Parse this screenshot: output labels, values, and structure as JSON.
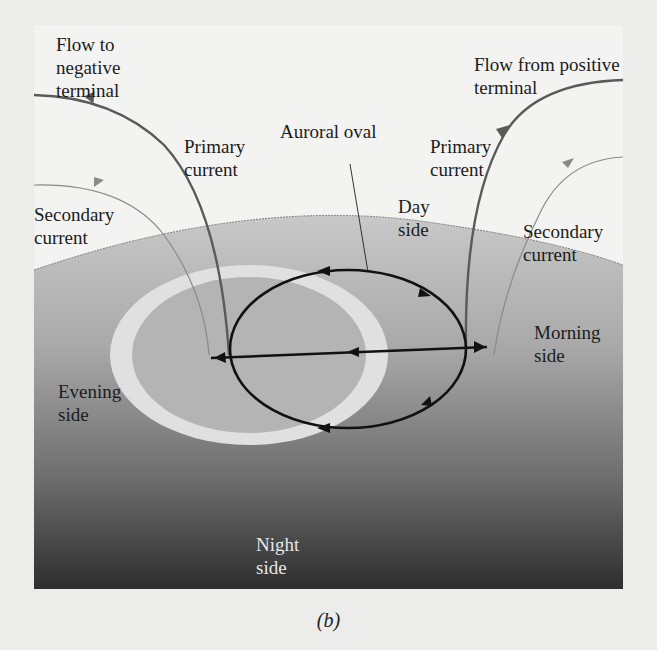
{
  "figure": {
    "caption": "(b)",
    "labels": {
      "flow_negative": "Flow to\nnegative\nterminal",
      "flow_positive": "Flow from positive\nterminal",
      "primary_left": "Primary\ncurrent",
      "primary_right": "Primary\ncurrent",
      "secondary_left": "Secondary\ncurrent",
      "secondary_right": "Secondary\ncurrent",
      "auroral_oval": "Auroral oval",
      "day_side": "Day\nside",
      "evening_side": "Evening\nside",
      "morning_side": "Morning\nside",
      "night_side": "Night\nside"
    },
    "colors": {
      "background": "#ececea",
      "panel": "#f3f3f1",
      "globe_top": "#c4c4c4",
      "globe_bottom": "#3a3a3a",
      "oval_ring": "#e2e2e2",
      "current_loop": "#111111",
      "primary_current": "#5a5a5a",
      "secondary_current": "#8a8a8a"
    }
  }
}
